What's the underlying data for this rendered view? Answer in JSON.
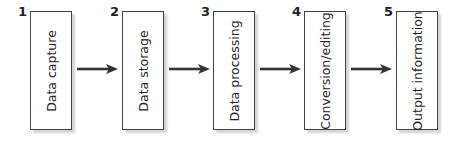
{
  "diagram": {
    "type": "flow",
    "direction": "left-to-right",
    "steps": [
      {
        "number": "1",
        "label": "Data capture"
      },
      {
        "number": "2",
        "label": "Data storage"
      },
      {
        "number": "3",
        "label": "Data processing"
      },
      {
        "number": "4",
        "label": "Conversion/editing"
      },
      {
        "number": "5",
        "label": "Output information"
      }
    ],
    "colors": {
      "border": "#444444",
      "arrow": "#333333",
      "text": "#222222",
      "shadow": "#d4d4d4"
    }
  }
}
